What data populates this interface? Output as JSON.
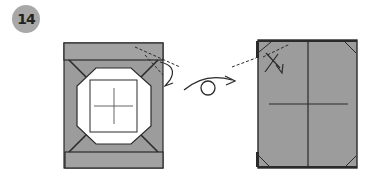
{
  "step": {
    "number": "14"
  },
  "colors": {
    "paper": "#9c9c9c",
    "paper_light": "#a4a4a4",
    "line": "#2a2a2a",
    "white": "#ffffff",
    "badge": "#a8a8a8"
  },
  "symbols": {
    "fold_arrow": "valley-fold-arrow",
    "turn_over": "turn-over-symbol"
  }
}
